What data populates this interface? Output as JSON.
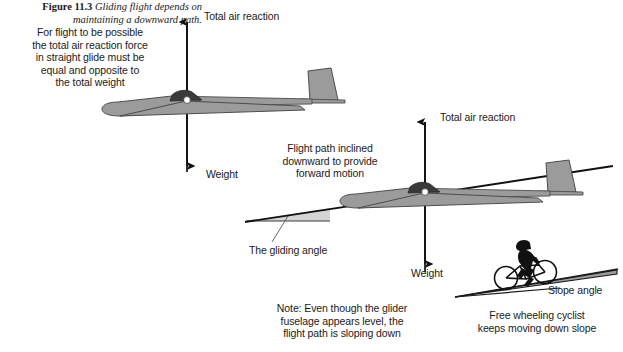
{
  "figure": {
    "caption_number": "Figure 11.3",
    "caption_text": "Gliding flight depends on maintaining a downward path.",
    "background_color": "#ffffff",
    "ink_color": "#1a1a1a",
    "glider_fill_color": "#9b9b9b",
    "glider_stroke_color": "#4d4d4d",
    "wedge_fill_color": "#d0d0d0",
    "canopy_color": "#3a3a3a"
  },
  "annotations": {
    "equal_opposite_note": "For flight to be possible\nthe total air reaction force\nin straight glide must be\nequal and opposite to\nthe total weight",
    "total_air_reaction_1": "Total air reaction",
    "weight_1": "Weight",
    "flight_path_note": "Flight path inclined\ndownward to provide\nforward motion",
    "total_air_reaction_2": "Total air reaction",
    "weight_2": "Weight",
    "gliding_angle": "The gliding angle",
    "slope_angle": "Slope angle",
    "cyclist_note": "Free wheeling cyclist\nkeeps moving down slope",
    "fuselage_note": "Note: Even though the glider\nfuselage appears level, the\nflight path is sloping down"
  },
  "diagram_parts": {
    "glider_upper": "glider-side-view-level",
    "glider_lower": "glider-side-view-on-flight-path",
    "force_arrow_up_1": "total-air-reaction-arrow",
    "force_arrow_down_1": "weight-arrow",
    "force_arrow_up_2": "total-air-reaction-arrow",
    "force_arrow_down_2": "weight-arrow",
    "flight_path_line": "inclined-flight-path-line",
    "gliding_angle_wedge": "gliding-angle-wedge",
    "slope_wedge": "slope-wedge",
    "cyclist": "free-wheeling-cyclist"
  }
}
